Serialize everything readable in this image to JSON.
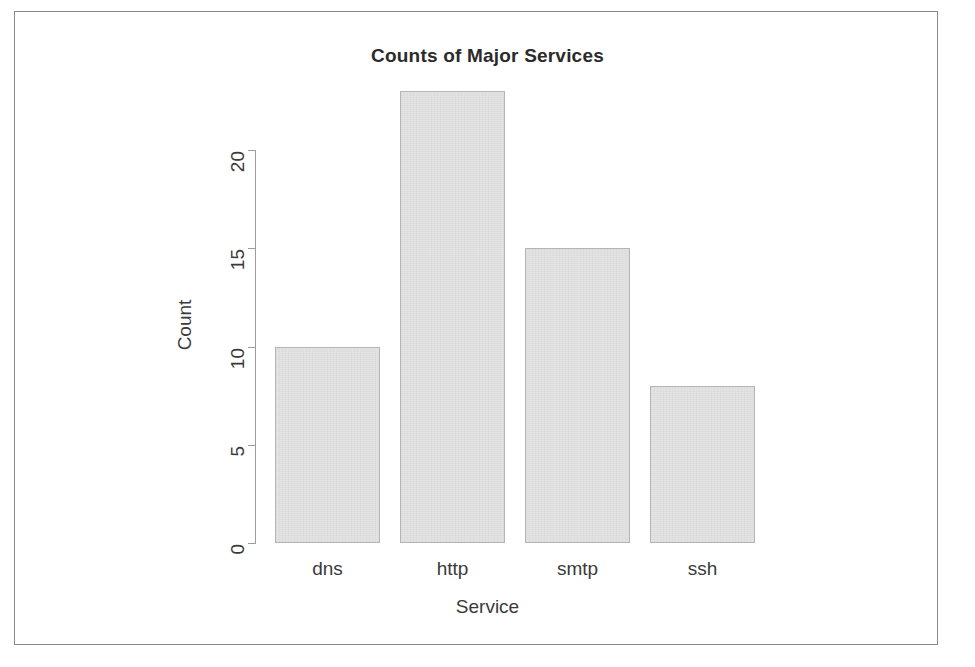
{
  "chart_data": {
    "type": "bar",
    "title": "Counts of Major Services",
    "xlabel": "Service",
    "ylabel": "Count",
    "categories": [
      "dns",
      "http",
      "smtp",
      "ssh"
    ],
    "values": [
      10,
      23,
      15,
      8
    ],
    "ytick_labels": [
      "0",
      "5",
      "10",
      "15",
      "20"
    ],
    "ytick_values": [
      0,
      5,
      10,
      15,
      20
    ],
    "ylim": [
      0,
      20
    ],
    "grid": false,
    "legend": null,
    "bar_fill_color": "#e2e2e2",
    "bar_border_color": "#b5b5b5",
    "axis_color": "#9c9c9c",
    "text_color": "#3a3a3a",
    "frame_color": "#8a8a8a",
    "background_color": "#ffffff"
  }
}
